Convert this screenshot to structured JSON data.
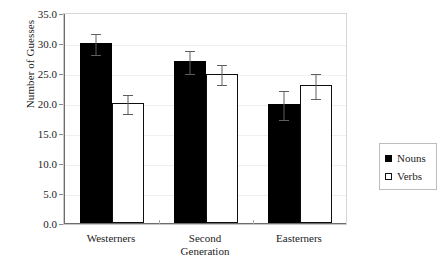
{
  "chart_data": {
    "type": "bar",
    "title": "",
    "subtitle": "",
    "xlabel": "",
    "ylabel": "Number of Guesses",
    "categories": [
      "Westerners",
      "Second Generation",
      "Easterners"
    ],
    "category_lines": [
      [
        "Westerners"
      ],
      [
        "Second",
        "Generation"
      ],
      [
        "Easterners"
      ]
    ],
    "ylim": [
      0.0,
      35.0
    ],
    "ytick_step": 5.0,
    "ytick_labels": [
      "0.0",
      "5.0",
      "10.0",
      "15.0",
      "20.0",
      "25.0",
      "30.0",
      "35.0"
    ],
    "ytick_values": [
      0.0,
      5.0,
      10.0,
      15.0,
      20.0,
      25.0,
      30.0,
      35.0
    ],
    "grid": "faint-horizontal",
    "legend_position": "right-outside",
    "series": [
      {
        "name": "Nouns",
        "color": "#000000",
        "style": "filled",
        "values": [
          30.0,
          27.0,
          19.8
        ],
        "errors": [
          1.8,
          2.0,
          2.5
        ]
      },
      {
        "name": "Verbs",
        "color": "#ffffff",
        "edge_color": "#000000",
        "style": "open",
        "values": [
          20.0,
          24.9,
          23.0
        ],
        "errors": [
          1.6,
          1.7,
          2.1
        ]
      }
    ]
  },
  "legend": {
    "entries": [
      {
        "label": "Nouns",
        "swatch": "filled-square"
      },
      {
        "label": "Verbs",
        "swatch": "open-square"
      }
    ]
  },
  "axes": {
    "y_title": "Number of Guesses",
    "y_max_label": "35.0",
    "y_min_label": "0.0"
  }
}
